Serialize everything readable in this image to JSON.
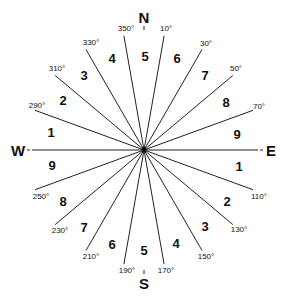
{
  "diagram": {
    "center": [
      144,
      150
    ],
    "radius": 116,
    "cardinals": [
      {
        "label": "N",
        "x": 144,
        "y": 23
      },
      {
        "label": "S",
        "x": 144,
        "y": 289
      },
      {
        "label": "W",
        "x": 18,
        "y": 156
      },
      {
        "label": "E",
        "x": 271,
        "y": 156
      }
    ],
    "rays_deg": [
      10,
      30,
      50,
      70,
      110,
      130,
      150,
      170,
      190,
      210,
      230,
      250,
      290,
      310,
      330,
      350
    ],
    "degree_labels": [
      {
        "text": "350°",
        "x": 126,
        "y": 31
      },
      {
        "text": "10°",
        "x": 166,
        "y": 31
      },
      {
        "text": "330°",
        "x": 91,
        "y": 45
      },
      {
        "text": "30°",
        "x": 206,
        "y": 46
      },
      {
        "text": "310°",
        "x": 57,
        "y": 71
      },
      {
        "text": "50°",
        "x": 236,
        "y": 71
      },
      {
        "text": "290°",
        "x": 37,
        "y": 108
      },
      {
        "text": "70°",
        "x": 259,
        "y": 109
      },
      {
        "text": "250°",
        "x": 41,
        "y": 199
      },
      {
        "text": "110°",
        "x": 259,
        "y": 199
      },
      {
        "text": "230°",
        "x": 60,
        "y": 233
      },
      {
        "text": "130°",
        "x": 239,
        "y": 232
      },
      {
        "text": "210°",
        "x": 91,
        "y": 259
      },
      {
        "text": "150°",
        "x": 206,
        "y": 259
      },
      {
        "text": "190°",
        "x": 127,
        "y": 273
      },
      {
        "text": "170°",
        "x": 166,
        "y": 273
      }
    ],
    "sector_numbers": [
      {
        "text": "5",
        "x": 145,
        "y": 61
      },
      {
        "text": "6",
        "x": 177,
        "y": 63
      },
      {
        "text": "4",
        "x": 112,
        "y": 63
      },
      {
        "text": "7",
        "x": 205,
        "y": 80
      },
      {
        "text": "3",
        "x": 84,
        "y": 80
      },
      {
        "text": "8",
        "x": 226,
        "y": 107
      },
      {
        "text": "2",
        "x": 63,
        "y": 105
      },
      {
        "text": "9",
        "x": 237,
        "y": 139
      },
      {
        "text": "1",
        "x": 51,
        "y": 137
      },
      {
        "text": "1",
        "x": 239,
        "y": 171
      },
      {
        "text": "9",
        "x": 52,
        "y": 170
      },
      {
        "text": "2",
        "x": 227,
        "y": 206
      },
      {
        "text": "8",
        "x": 63,
        "y": 206
      },
      {
        "text": "3",
        "x": 205,
        "y": 231
      },
      {
        "text": "7",
        "x": 84,
        "y": 232
      },
      {
        "text": "4",
        "x": 176,
        "y": 248
      },
      {
        "text": "6",
        "x": 112,
        "y": 249
      },
      {
        "text": "5",
        "x": 144,
        "y": 255
      }
    ]
  }
}
